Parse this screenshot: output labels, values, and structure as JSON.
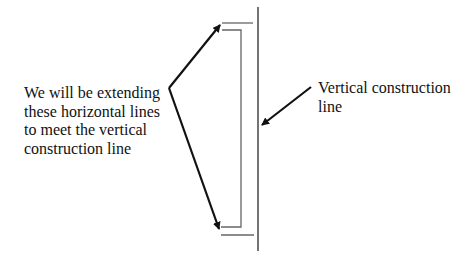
{
  "labels": {
    "left_lines": [
      "We will be extending",
      "these horizontal lines",
      "to meet the vertical",
      "construction line"
    ],
    "right_lines": [
      "Vertical construction",
      "line"
    ]
  },
  "colors": {
    "background": "#ffffff",
    "ink": "#111111",
    "construction_lines": "#555555"
  }
}
